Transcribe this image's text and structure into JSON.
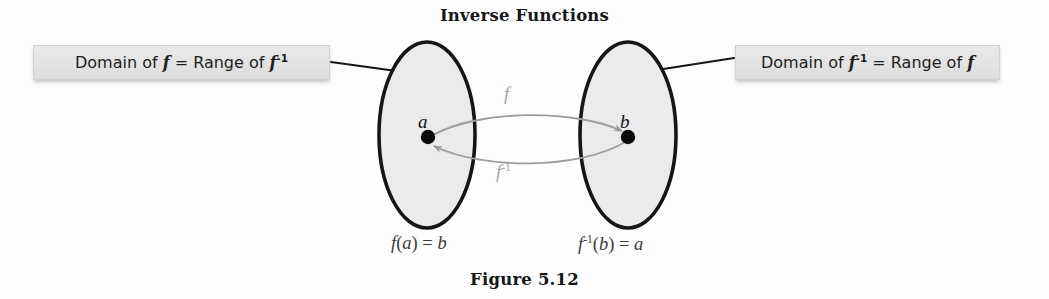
{
  "figure": {
    "title": "Inverse Functions",
    "caption": "Figure 5.12",
    "background_color": "#fdfdfd"
  },
  "callouts": {
    "left": {
      "prefix": "Domain of ",
      "var1": "f",
      "middle": " = Range of ",
      "var2": "f",
      "exponent2": "-1",
      "fill_color": "#e3e3e3"
    },
    "right": {
      "prefix": "Domain of ",
      "var1": "f",
      "exponent1": "-1",
      "middle": " = Range of ",
      "var2": "f",
      "fill_color": "#e3e3e3"
    }
  },
  "sets": {
    "left": {
      "point_label": "a",
      "fill_color": "#ebebeb",
      "stroke_color": "#151515"
    },
    "right": {
      "point_label": "b",
      "fill_color": "#ebebeb",
      "stroke_color": "#151515"
    }
  },
  "mappings": {
    "forward": {
      "label": "f",
      "exponent": "",
      "color": "#a6a6a6",
      "direction": "left-to-right"
    },
    "inverse": {
      "label": "f",
      "exponent": "-1",
      "color": "#a6a6a6",
      "direction": "right-to-left"
    }
  },
  "equations": {
    "left": {
      "fn": "f",
      "exponent": "",
      "open": "(",
      "arg": "a",
      "close": ")",
      "equals": " = ",
      "result": "b"
    },
    "right": {
      "fn": "f",
      "exponent": "-1",
      "open": "(",
      "arg": "b",
      "close": ")",
      "equals": " = ",
      "result": "a"
    }
  }
}
